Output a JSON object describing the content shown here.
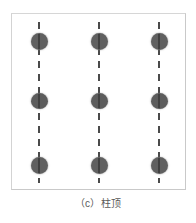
{
  "figure": {
    "caption": "（c）柱顶",
    "caption_label": "(c)",
    "caption_text": "柱顶",
    "frame": {
      "border_color": "#cfcfcf",
      "background_color": "#ffffff",
      "x": 11,
      "y": 13,
      "width": 175,
      "height": 177
    },
    "colors": {
      "node_fill": "#606060",
      "dashed_line": "#4a4a4a",
      "caption_text": "#595959",
      "page_background": "#ffffff"
    },
    "columns": [
      {
        "name": "column-1",
        "x": 38,
        "nodes": [
          {
            "name": "node-top",
            "y": 40,
            "shape": "circle"
          },
          {
            "name": "node-middle",
            "y": 100,
            "shape": "circle"
          },
          {
            "name": "node-bottom",
            "y": 164,
            "shape": "circle"
          }
        ]
      },
      {
        "name": "column-2",
        "x": 98,
        "nodes": [
          {
            "name": "node-top",
            "y": 40,
            "shape": "circle"
          },
          {
            "name": "node-middle",
            "y": 100,
            "shape": "circle"
          },
          {
            "name": "node-bottom",
            "y": 164,
            "shape": "circle"
          }
        ]
      },
      {
        "name": "column-3",
        "x": 158,
        "nodes": [
          {
            "name": "node-top",
            "y": 40,
            "shape": "circle"
          },
          {
            "name": "node-middle",
            "y": 100,
            "shape": "circle"
          },
          {
            "name": "node-bottom",
            "y": 164,
            "shape": "circle"
          }
        ]
      }
    ]
  }
}
